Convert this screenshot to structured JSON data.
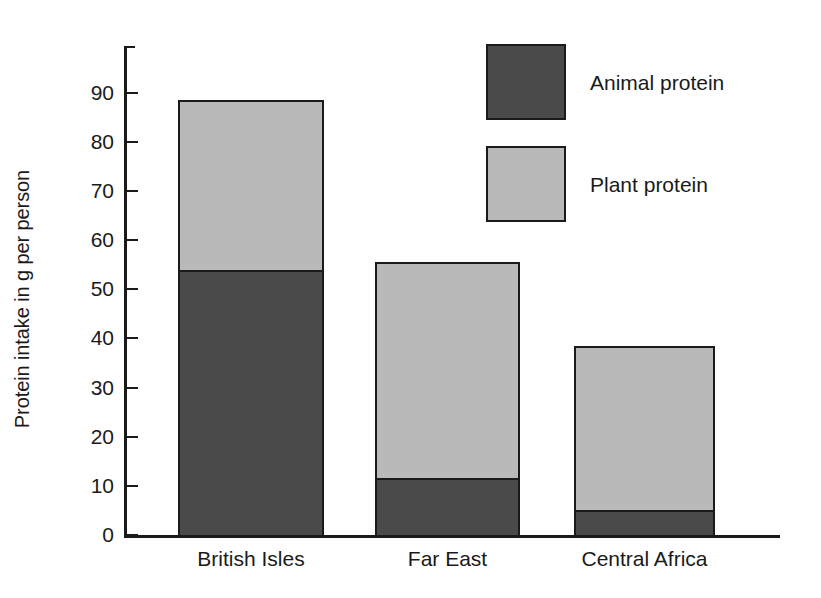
{
  "chart_data": {
    "type": "bar",
    "stacked": true,
    "title": "",
    "subtitle": "",
    "xlabel": "",
    "ylabel": "Protein intake in g per person",
    "categories": [
      "British Isles",
      "Far East",
      "Central Africa"
    ],
    "series": [
      {
        "name": "Animal protein",
        "color": "#4a4a4a",
        "values": [
          54,
          11.5,
          5
        ]
      },
      {
        "name": "Plant protein",
        "color": "#b9b9b9",
        "values": [
          34.5,
          44,
          33.5
        ]
      }
    ],
    "totals": [
      88.5,
      55.5,
      38.5
    ],
    "ylim": [
      0,
      96
    ],
    "yticks": [
      0,
      10,
      20,
      30,
      40,
      50,
      60,
      70,
      80,
      90
    ],
    "ytick_labels": [
      "0",
      "10",
      "20",
      "30",
      "40",
      "50",
      "60",
      "70",
      "80",
      "90"
    ],
    "grid": false,
    "legend_position": "top-right",
    "legend": [
      {
        "label": "Animal protein",
        "swatch": "#4a4a4a"
      },
      {
        "label": "Plant protein",
        "swatch": "#b9b9b9"
      }
    ]
  },
  "axis": {
    "y_title": "Protein intake in g per person"
  },
  "colors": {
    "animal_protein": "#4a4a4a",
    "plant_protein": "#b9b9b9",
    "axis": "#1a1a1a",
    "background": "#ffffff"
  }
}
